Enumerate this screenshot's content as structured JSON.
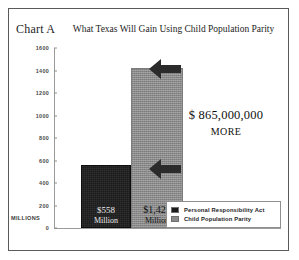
{
  "figure": {
    "chart_label": "Chart A",
    "frame_border_color": "#5a5a5a",
    "background": "#ffffff"
  },
  "annotation": {
    "amount": "$ 865,000,000",
    "more": "MORE"
  },
  "axis": {
    "unit_label": "MILLIONS"
  },
  "legend": {
    "items": [
      {
        "label": "Personal Responsibility Act",
        "color": "#1b1b1b"
      },
      {
        "label": "Child Population Parity",
        "color": "#8a8a8a"
      }
    ]
  },
  "bars": {
    "pra": {
      "value_label": "$558",
      "unit_label": "Million"
    },
    "cpp": {
      "value_label": "$1,423",
      "unit_label": "Million"
    }
  },
  "icons": {
    "arrow_top": "arrow-left-icon",
    "arrow_bottom": "arrow-left-icon"
  },
  "chart_data": {
    "type": "bar",
    "title": "What Texas Will Gain Using Child Population Parity",
    "xlabel": "",
    "ylabel": "MILLIONS",
    "ylim": [
      0,
      1600
    ],
    "yticks": [
      1600,
      1400,
      1200,
      1000,
      800,
      600,
      400,
      200,
      0
    ],
    "ytick_labels": [
      "1600",
      "1400",
      "1200",
      "1000",
      "800",
      "600",
      "400",
      "200",
      "0"
    ],
    "grid": false,
    "legend_position": "bottom-right",
    "categories": [
      "Personal Responsibility Act",
      "Child Population Parity"
    ],
    "values": [
      558,
      1423
    ],
    "value_labels": [
      "$558 Million",
      "$1,423 Million"
    ],
    "colors": [
      "#1b1b1b",
      "#8a8a8a"
    ],
    "annotations": [
      {
        "text": "$ 865,000,000 MORE",
        "value": 865000000,
        "note": "Difference between Child Population Parity and Personal Responsibility Act"
      }
    ]
  }
}
